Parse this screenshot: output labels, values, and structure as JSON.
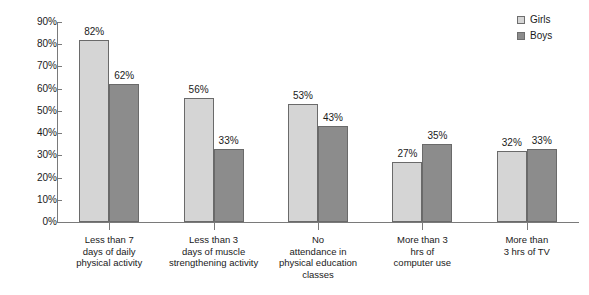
{
  "chart_data": {
    "type": "bar",
    "title": "",
    "xlabel": "",
    "ylabel": "",
    "ylim": [
      0,
      90
    ],
    "grid": false,
    "legend_position": "top-right",
    "categories": [
      "Less than 7 days of daily physical activity",
      "Less than 3 days of muscle strengthening activity",
      "No attendance in physical education classes",
      "More than 3 hrs of computer use",
      "More than 3 hrs of TV"
    ],
    "category_lines": [
      [
        "Less than 7",
        "days of daily",
        "physical activity"
      ],
      [
        "Less than 3",
        "days of muscle",
        "strengthening activity"
      ],
      [
        "No",
        "attendance in",
        "physical education",
        "classes"
      ],
      [
        "More than 3",
        "hrs of",
        "computer use"
      ],
      [
        "More than",
        "3 hrs of TV"
      ]
    ],
    "series": [
      {
        "name": "Girls",
        "color": "#d5d5d5",
        "values": [
          82,
          56,
          53,
          27,
          32
        ],
        "labels": [
          "82%",
          "56%",
          "53%",
          "27%",
          "32%"
        ]
      },
      {
        "name": "Boys",
        "color": "#8c8c8c",
        "values": [
          62,
          33,
          43,
          35,
          33
        ],
        "labels": [
          "62%",
          "33%",
          "43%",
          "35%",
          "33%"
        ]
      }
    ],
    "y_ticks": [
      0,
      10,
      20,
      30,
      40,
      50,
      60,
      70,
      80,
      90
    ],
    "y_tick_labels": [
      "0%",
      "10%",
      "20%",
      "30%",
      "40%",
      "50%",
      "60%",
      "70%",
      "80%",
      "90%"
    ]
  },
  "legend": {
    "items": [
      {
        "label": "Girls",
        "color": "#d5d5d5"
      },
      {
        "label": "Boys",
        "color": "#8c8c8c"
      }
    ]
  },
  "axis": {
    "line_color": "#7a7a7a"
  }
}
